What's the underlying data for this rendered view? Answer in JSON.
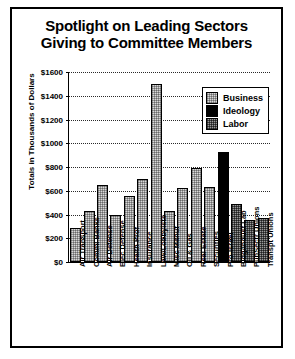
{
  "title": {
    "line1": "Spotlight on Leading Sectors",
    "line2": "Giving to Committee Members"
  },
  "legend": {
    "position": "top-right",
    "items": [
      {
        "label": "Business",
        "color": "#d8d8d8",
        "pattern": "light-stipple"
      },
      {
        "label": "Ideology",
        "color": "#000000",
        "pattern": "solid-black"
      },
      {
        "label": "Labor",
        "color": "#9a9a9a",
        "pattern": "dark-stipple"
      }
    ]
  },
  "chart_data": {
    "type": "bar",
    "title": "Spotlight on Leading Sectors Giving to Committee Members",
    "xlabel": "",
    "ylabel": "Totals in Thousands of Dollars",
    "ylim": [
      0,
      1600
    ],
    "ytick_labels": [
      "$1600",
      "$1400",
      "$1200",
      "$1000",
      "$800",
      "$600",
      "$400",
      "$200",
      "$0"
    ],
    "ytick_values": [
      1600,
      1400,
      1200,
      1000,
      800,
      600,
      400,
      200,
      0
    ],
    "grid": true,
    "categories": [
      "Air Transport",
      "Comml Banks",
      "Air Defense",
      "Elec Defense",
      "Health Prof",
      "Insurance",
      "Law/Lobbyists",
      "Misc Manuf",
      "Oil & Gas",
      "Real Estate",
      "Securities",
      "Pro-Israel",
      "Bldg/Indust Lab",
      "PubSectr Unions",
      "Transpt Unions"
    ],
    "values": [
      290,
      430,
      650,
      400,
      560,
      700,
      1500,
      430,
      620,
      790,
      630,
      930,
      490,
      350,
      370
    ],
    "groups": [
      "Business",
      "Business",
      "Business",
      "Business",
      "Business",
      "Business",
      "Business",
      "Business",
      "Business",
      "Business",
      "Business",
      "Ideology",
      "Labor",
      "Labor",
      "Labor"
    ]
  }
}
